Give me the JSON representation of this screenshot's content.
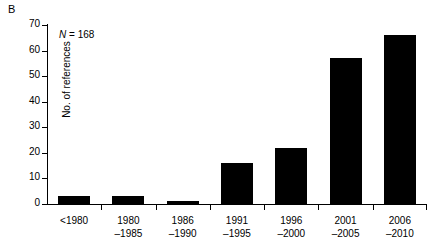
{
  "panel": {
    "label": "B"
  },
  "chart_data": {
    "type": "bar",
    "title": "",
    "subtitle": "",
    "xlabel": "",
    "ylabel": "No. of references",
    "categories": [
      "<1980",
      "1980–1985",
      "1986–1990",
      "1991–1995",
      "1996–2000",
      "2001–2005",
      "2006–2010"
    ],
    "category_lines": [
      {
        "line1": "<1980",
        "line2": ""
      },
      {
        "line1": "1980",
        "line2": "–1985"
      },
      {
        "line1": "1986",
        "line2": "–1990"
      },
      {
        "line1": "1991",
        "line2": "–1995"
      },
      {
        "line1": "1996",
        "line2": "–2000"
      },
      {
        "line1": "2001",
        "line2": "–2005"
      },
      {
        "line1": "2006",
        "line2": "–2010"
      }
    ],
    "values": [
      3,
      3,
      1,
      16,
      22,
      57,
      66
    ],
    "ylim": [
      0,
      70
    ],
    "yticks": [
      0,
      10,
      20,
      30,
      40,
      50,
      60,
      70
    ],
    "ytick_labels": [
      "0",
      "10",
      "20",
      "30",
      "40",
      "50",
      "60",
      "70"
    ],
    "grid": false,
    "legend": false,
    "bar_color": "#000000",
    "annotations": [
      {
        "name": "sample-size",
        "symbol": "N",
        "separator": " = ",
        "value": "168",
        "text": "N = 168"
      }
    ]
  }
}
